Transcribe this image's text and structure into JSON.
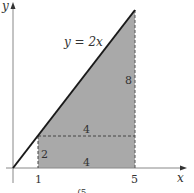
{
  "figure": {
    "curve_label": "y = 2x",
    "axes": {
      "x_label": "x",
      "y_label": "y",
      "x_ticks": [
        "1",
        "5"
      ]
    },
    "region_labels": {
      "right_height": "8",
      "upper_width": "4",
      "rect_height": "2",
      "rect_width": "4"
    },
    "bottom_fragment": "∫5",
    "colors": {
      "shade": "#a9a9a9",
      "line": "#1a1a1a",
      "axis": "#777777",
      "dash": "#444444"
    }
  }
}
